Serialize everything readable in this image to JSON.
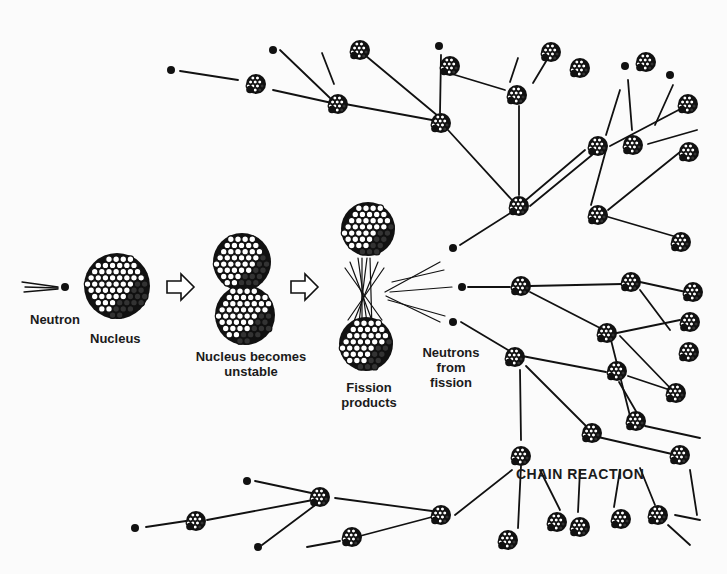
{
  "colors": {
    "ink": "#111111",
    "paper": "#fbfbfb",
    "proton_fill": "#ffffff"
  },
  "labels": {
    "neutron": "Neutron",
    "nucleus": "Nucleus",
    "unstable_line1": "Nucleus becomes",
    "unstable_line2": "unstable",
    "fission_line1": "Fission",
    "fission_line2": "products",
    "neutrons_line1": "Neutrons",
    "neutrons_line2": "from",
    "neutrons_line3": "fission",
    "chain_reaction": "CHAIN REACTION"
  },
  "stages": [
    {
      "name": "incoming-neutron",
      "x": 65,
      "y": 287
    },
    {
      "name": "nucleus",
      "x": 117,
      "y": 286,
      "r": 33
    },
    {
      "name": "arrow-1",
      "x": 183,
      "y": 287
    },
    {
      "name": "unstable-top",
      "x": 242,
      "y": 262,
      "r": 29
    },
    {
      "name": "unstable-bottom",
      "x": 245,
      "y": 315,
      "r": 30
    },
    {
      "name": "arrow-2",
      "x": 307,
      "y": 287
    },
    {
      "name": "fission-top",
      "x": 368,
      "y": 229,
      "r": 27
    },
    {
      "name": "fission-bottom",
      "x": 366,
      "y": 344,
      "r": 27
    }
  ],
  "free_neutrons": [
    [
      171,
      70
    ],
    [
      273,
      50
    ],
    [
      439,
      46
    ],
    [
      625,
      66
    ],
    [
      670,
      75
    ],
    [
      453,
      248
    ],
    [
      462,
      287
    ],
    [
      453,
      322
    ],
    [
      247,
      481
    ],
    [
      135,
      528
    ],
    [
      258,
      547
    ]
  ],
  "small_nuclei": [
    [
      256,
      84
    ],
    [
      338,
      104
    ],
    [
      441,
      123
    ],
    [
      360,
      50
    ],
    [
      450,
      66
    ],
    [
      517,
      95
    ],
    [
      551,
      52
    ],
    [
      580,
      68
    ],
    [
      646,
      62
    ],
    [
      688,
      104
    ],
    [
      519,
      206
    ],
    [
      598,
      146
    ],
    [
      633,
      145
    ],
    [
      689,
      152
    ],
    [
      598,
      215
    ],
    [
      681,
      242
    ],
    [
      521,
      286
    ],
    [
      631,
      282
    ],
    [
      693,
      292
    ],
    [
      607,
      333
    ],
    [
      690,
      322
    ],
    [
      689,
      352
    ],
    [
      515,
      357
    ],
    [
      617,
      371
    ],
    [
      676,
      393
    ],
    [
      636,
      421
    ],
    [
      592,
      433
    ],
    [
      680,
      455
    ],
    [
      521,
      456
    ],
    [
      320,
      497
    ],
    [
      441,
      515
    ],
    [
      196,
      521
    ],
    [
      352,
      537
    ],
    [
      508,
      540
    ],
    [
      557,
      522
    ],
    [
      580,
      527
    ],
    [
      621,
      519
    ],
    [
      658,
      515
    ]
  ],
  "lines": [
    [
      180,
      71,
      238,
      80
    ],
    [
      280,
      50,
      330,
      98
    ],
    [
      322,
      53,
      334,
      84
    ],
    [
      273,
      90,
      332,
      103
    ],
    [
      345,
      104,
      432,
      120
    ],
    [
      366,
      56,
      438,
      116
    ],
    [
      441,
      55,
      440,
      113
    ],
    [
      452,
      74,
      505,
      90
    ],
    [
      518,
      58,
      510,
      82
    ],
    [
      548,
      58,
      533,
      83
    ],
    [
      519,
      106,
      519,
      195
    ],
    [
      448,
      130,
      512,
      200
    ],
    [
      526,
      200,
      585,
      150
    ],
    [
      610,
      146,
      688,
      105
    ],
    [
      620,
      90,
      606,
      135
    ],
    [
      628,
      80,
      632,
      130
    ],
    [
      673,
      85,
      655,
      125
    ],
    [
      648,
      144,
      697,
      130
    ],
    [
      530,
      206,
      592,
      155
    ],
    [
      606,
      150,
      591,
      205
    ],
    [
      608,
      210,
      680,
      152
    ],
    [
      605,
      216,
      680,
      238
    ],
    [
      460,
      245,
      512,
      212
    ],
    [
      468,
      287,
      510,
      287
    ],
    [
      530,
      286,
      622,
      284
    ],
    [
      640,
      282,
      686,
      292
    ],
    [
      461,
      322,
      508,
      350
    ],
    [
      530,
      292,
      600,
      328
    ],
    [
      640,
      290,
      670,
      330
    ],
    [
      612,
      334,
      680,
      320
    ],
    [
      620,
      336,
      675,
      393
    ],
    [
      611,
      340,
      630,
      416
    ],
    [
      522,
      356,
      606,
      372
    ],
    [
      526,
      366,
      588,
      428
    ],
    [
      520,
      370,
      521,
      440
    ],
    [
      628,
      376,
      670,
      390
    ],
    [
      619,
      382,
      637,
      413
    ],
    [
      598,
      437,
      672,
      454
    ],
    [
      645,
      426,
      700,
      438
    ],
    [
      521,
      466,
      518,
      528
    ],
    [
      540,
      470,
      560,
      510
    ],
    [
      580,
      470,
      578,
      512
    ],
    [
      620,
      470,
      614,
      507
    ],
    [
      640,
      468,
      655,
      505
    ],
    [
      690,
      470,
      697,
      515
    ],
    [
      455,
      515,
      512,
      470
    ],
    [
      335,
      498,
      432,
      511
    ],
    [
      255,
      481,
      316,
      494
    ],
    [
      146,
      527,
      186,
      521
    ],
    [
      207,
      520,
      313,
      500
    ],
    [
      262,
      545,
      318,
      503
    ],
    [
      360,
      536,
      432,
      517
    ],
    [
      307,
      547,
      340,
      541
    ],
    [
      675,
      515,
      700,
      520
    ],
    [
      668,
      525,
      690,
      545
    ]
  ],
  "rays_left": [
    [
      22,
      282,
      58,
      287
    ],
    [
      25,
      287,
      58,
      288
    ],
    [
      24,
      292,
      58,
      289
    ]
  ],
  "explosion_rays": [
    [
      367,
      258,
      358,
      330
    ],
    [
      358,
      258,
      368,
      330
    ],
    [
      350,
      262,
      374,
      326
    ],
    [
      378,
      262,
      352,
      326
    ],
    [
      345,
      268,
      382,
      320
    ],
    [
      384,
      268,
      348,
      320
    ],
    [
      370,
      258,
      372,
      330
    ],
    [
      362,
      258,
      362,
      330
    ],
    [
      385,
      292,
      440,
      262
    ],
    [
      390,
      292,
      452,
      287
    ],
    [
      386,
      296,
      440,
      322
    ],
    [
      388,
      300,
      445,
      316
    ],
    [
      392,
      282,
      444,
      270
    ]
  ]
}
